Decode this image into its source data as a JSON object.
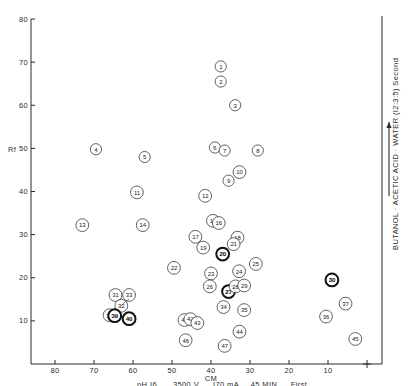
{
  "chart_data": {
    "type": "scatter",
    "title": "",
    "xlabel": "CM",
    "ylabel": "Rf",
    "xlim": [
      80,
      0
    ],
    "ylim": [
      0,
      80
    ],
    "x_reversed": true,
    "grid": false,
    "legend": "none",
    "xticks": [
      80,
      70,
      60,
      50,
      40,
      30,
      20,
      10
    ],
    "yticks": [
      10,
      20,
      30,
      40,
      50,
      60,
      70,
      80
    ],
    "origin_marker": "+",
    "x_axis_caption": "pH I6   3500 V   I70 mA   45 MIN   First",
    "x_axis_caption_parts": [
      "pH I6",
      "3500 V",
      "I70 mA",
      "45 MIN",
      "First"
    ],
    "x_axis_direction_arrow": "left",
    "y_right_caption": "BUTANOL · ACETIC ACID · WATER (I2:3:5)   Second",
    "y_right_direction_arrow": "up",
    "point_shape": "numbered-circle",
    "points": [
      {
        "label": "1",
        "x": 37.5,
        "y": 69.0,
        "bold": false
      },
      {
        "label": "2",
        "x": 37.5,
        "y": 65.5,
        "bold": false
      },
      {
        "label": "3",
        "x": 33.8,
        "y": 60.0,
        "bold": false
      },
      {
        "label": "4",
        "x": 69.5,
        "y": 49.8,
        "bold": false
      },
      {
        "label": "5",
        "x": 57.0,
        "y": 48.0,
        "bold": false
      },
      {
        "label": "6",
        "x": 39.0,
        "y": 50.2,
        "bold": false
      },
      {
        "label": "7",
        "x": 36.5,
        "y": 49.5,
        "bold": false
      },
      {
        "label": "8",
        "x": 28.0,
        "y": 49.5,
        "bold": false
      },
      {
        "label": "9",
        "x": 35.5,
        "y": 42.5,
        "bold": false
      },
      {
        "label": "10",
        "x": 32.7,
        "y": 44.5,
        "bold": false
      },
      {
        "label": "11",
        "x": 59.0,
        "y": 39.8,
        "bold": false
      },
      {
        "label": "12",
        "x": 41.5,
        "y": 39.0,
        "bold": false
      },
      {
        "label": "13",
        "x": 73.0,
        "y": 32.2,
        "bold": false
      },
      {
        "label": "14",
        "x": 57.5,
        "y": 32.2,
        "bold": false
      },
      {
        "label": "15",
        "x": 39.5,
        "y": 33.2,
        "bold": false
      },
      {
        "label": "16",
        "x": 38.0,
        "y": 32.7,
        "bold": false
      },
      {
        "label": "17",
        "x": 44.0,
        "y": 29.5,
        "bold": false
      },
      {
        "label": "18",
        "x": 33.2,
        "y": 29.3,
        "bold": false
      },
      {
        "label": "19",
        "x": 42.0,
        "y": 27.0,
        "bold": false
      },
      {
        "label": "20",
        "x": 37.0,
        "y": 25.5,
        "bold": true
      },
      {
        "label": "21",
        "x": 34.2,
        "y": 27.8,
        "bold": false
      },
      {
        "label": "22",
        "x": 49.5,
        "y": 22.3,
        "bold": false
      },
      {
        "label": "23",
        "x": 40.0,
        "y": 21.0,
        "bold": false
      },
      {
        "label": "24",
        "x": 32.8,
        "y": 21.5,
        "bold": false
      },
      {
        "label": "25",
        "x": 28.5,
        "y": 23.2,
        "bold": false
      },
      {
        "label": "26",
        "x": 40.3,
        "y": 18.0,
        "bold": false
      },
      {
        "label": "27",
        "x": 35.5,
        "y": 16.8,
        "bold": true
      },
      {
        "label": "28",
        "x": 33.7,
        "y": 18.0,
        "bold": false
      },
      {
        "label": "29",
        "x": 31.5,
        "y": 18.2,
        "bold": false
      },
      {
        "label": "30",
        "x": 9.0,
        "y": 19.5,
        "bold": true
      },
      {
        "label": "31",
        "x": 64.5,
        "y": 16.0,
        "bold": false
      },
      {
        "label": "32",
        "x": 63.0,
        "y": 13.5,
        "bold": false
      },
      {
        "label": "33",
        "x": 61.0,
        "y": 16.0,
        "bold": false
      },
      {
        "label": "34",
        "x": 36.8,
        "y": 13.2,
        "bold": false
      },
      {
        "label": "35",
        "x": 31.5,
        "y": 12.5,
        "bold": false
      },
      {
        "label": "36",
        "x": 10.5,
        "y": 11.0,
        "bold": false
      },
      {
        "label": "37",
        "x": 5.5,
        "y": 14.0,
        "bold": false
      },
      {
        "label": "38",
        "x": 66.0,
        "y": 11.3,
        "bold": false
      },
      {
        "label": "39",
        "x": 64.7,
        "y": 11.2,
        "bold": true
      },
      {
        "label": "40",
        "x": 61.0,
        "y": 10.5,
        "bold": true
      },
      {
        "label": "41",
        "x": 46.8,
        "y": 10.2,
        "bold": false
      },
      {
        "label": "42",
        "x": 45.3,
        "y": 10.4,
        "bold": false
      },
      {
        "label": "43",
        "x": 43.5,
        "y": 9.5,
        "bold": false
      },
      {
        "label": "44",
        "x": 32.7,
        "y": 7.5,
        "bold": false
      },
      {
        "label": "45",
        "x": 3.0,
        "y": 5.8,
        "bold": false
      },
      {
        "label": "46",
        "x": 46.5,
        "y": 5.5,
        "bold": false
      },
      {
        "label": "47",
        "x": 36.5,
        "y": 4.2,
        "bold": false
      }
    ],
    "leader_lines": [
      {
        "from_label": "32",
        "to_label": "33"
      }
    ]
  }
}
